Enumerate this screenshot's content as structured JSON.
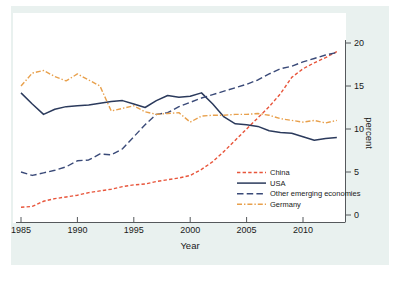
{
  "figure": {
    "background_outer": "#ffffff",
    "background_panel_surround": "#e9f1ef",
    "background_plot": "#ffffff"
  },
  "chart_data": {
    "type": "line",
    "title": "",
    "xlabel": "Year",
    "ylabel": "percent",
    "xlim": [
      1985,
      2013
    ],
    "ylim": [
      0,
      20
    ],
    "xticks": [
      "1985",
      "1990",
      "1995",
      "2000",
      "2005",
      "2010"
    ],
    "xtick_values": [
      1985,
      1990,
      1995,
      2000,
      2005,
      2010
    ],
    "yticks": [
      "0",
      "5",
      "10",
      "15",
      "20"
    ],
    "ytick_values": [
      0,
      5,
      10,
      15,
      20
    ],
    "y_axis_position": "right",
    "grid": false,
    "legend_position": "lower right",
    "x": [
      1985,
      1986,
      1987,
      1988,
      1989,
      1990,
      1991,
      1992,
      1993,
      1994,
      1995,
      1996,
      1997,
      1998,
      1999,
      2000,
      2001,
      2002,
      2003,
      2004,
      2005,
      2006,
      2007,
      2008,
      2009,
      2010,
      2011,
      2012,
      2013
    ],
    "series": [
      {
        "name": "China",
        "color": "#e8553b",
        "style": "dashed",
        "values": [
          0.9,
          1.0,
          1.6,
          1.9,
          2.1,
          2.3,
          2.6,
          2.8,
          3.0,
          3.3,
          3.5,
          3.6,
          3.9,
          4.1,
          4.3,
          4.6,
          5.3,
          6.2,
          7.4,
          8.7,
          10.0,
          11.3,
          12.6,
          14.1,
          16.0,
          17.0,
          17.7,
          18.3,
          19.0
        ]
      },
      {
        "name": "USA",
        "color": "#2b3a5c",
        "style": "solid",
        "values": [
          14.2,
          12.9,
          11.7,
          12.3,
          12.6,
          12.7,
          12.8,
          13.0,
          13.2,
          13.3,
          12.9,
          12.5,
          13.3,
          13.9,
          13.7,
          13.8,
          14.2,
          12.9,
          11.4,
          10.6,
          10.5,
          10.3,
          9.8,
          9.6,
          9.5,
          9.1,
          8.7,
          8.9,
          9.0
        ]
      },
      {
        "name": "Other emerging economies",
        "color": "#3a4a78",
        "style": "longdash",
        "values": [
          5.0,
          4.6,
          4.9,
          5.2,
          5.6,
          6.3,
          6.4,
          7.1,
          7.0,
          7.7,
          9.1,
          10.5,
          11.7,
          11.9,
          12.6,
          13.1,
          13.6,
          14.0,
          14.4,
          14.8,
          15.2,
          15.7,
          16.4,
          17.0,
          17.3,
          17.8,
          18.2,
          18.6,
          18.9
        ]
      },
      {
        "name": "Germany",
        "color": "#e8a04c",
        "style": "dashdot",
        "values": [
          15.0,
          16.5,
          16.8,
          16.1,
          15.6,
          16.4,
          15.7,
          15.0,
          12.1,
          12.4,
          12.7,
          12.0,
          11.7,
          11.8,
          11.9,
          10.8,
          11.5,
          11.6,
          11.6,
          11.7,
          11.7,
          11.8,
          11.6,
          11.2,
          11.0,
          10.8,
          11.0,
          10.7,
          11.0
        ]
      }
    ]
  },
  "legend": {
    "entries": [
      {
        "label": "China"
      },
      {
        "label": "USA"
      },
      {
        "label": "Other emerging economies"
      },
      {
        "label": "Germany"
      }
    ]
  }
}
